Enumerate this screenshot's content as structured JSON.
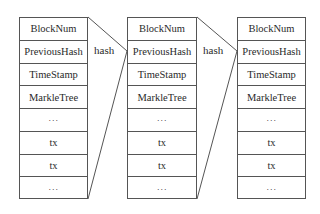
{
  "diagram": {
    "blocks": [
      {
        "rows": [
          "BlockNum",
          "PreviousHash",
          "TimeStamp",
          "MarkleTree",
          "···",
          "tx",
          "tx",
          "···"
        ]
      },
      {
        "rows": [
          "BlockNum",
          "PreviousHash",
          "TimeStamp",
          "MarkleTree",
          "···",
          "tx",
          "tx",
          "···"
        ]
      },
      {
        "rows": [
          "BlockNum",
          "PreviousHash",
          "TimeStamp",
          "MarkleTree",
          "···",
          "tx",
          "tx",
          "···"
        ]
      }
    ],
    "links": [
      {
        "label": "hash",
        "from_block": 0,
        "to_block": 1,
        "to_field": "PreviousHash"
      },
      {
        "label": "hash",
        "from_block": 1,
        "to_block": 2,
        "to_field": "PreviousHash"
      }
    ],
    "colors": {
      "line": "#555555",
      "text": "#2a2a2a",
      "background": "#ffffff"
    }
  }
}
